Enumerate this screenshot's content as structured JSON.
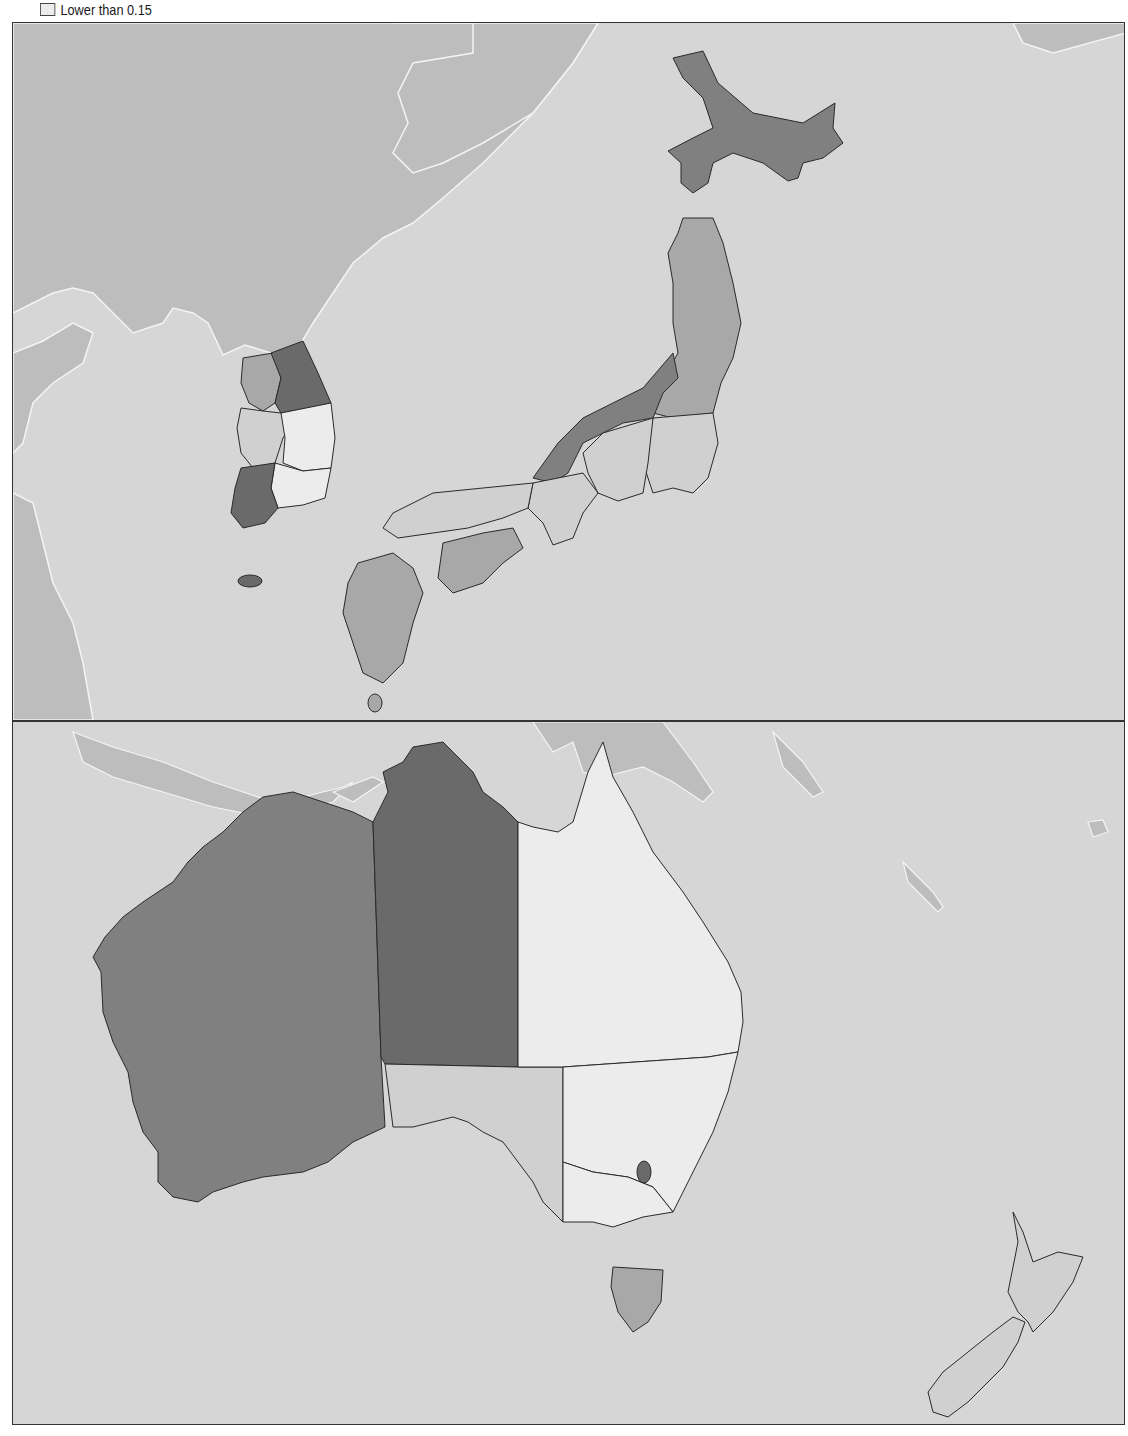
{
  "legend": {
    "items": [
      {
        "label": "Lower than 0.15",
        "color": "#ececec"
      }
    ]
  },
  "colors": {
    "sea": "#d6d6d6",
    "foreign_land": "#bdbdbd",
    "coast_white": "#f4f4f4",
    "class_darkest": "#6a6a6a",
    "class_dark": "#808080",
    "class_mid": "#a8a8a8",
    "class_light": "#d0d0d0",
    "class_lowest": "#ececec",
    "border": "#2a2a2a"
  },
  "panels": [
    {
      "name": "East Asia (Korea & Japan)",
      "regions": [
        {
          "country": "South Korea",
          "region": "Gangwon",
          "class": "class_darkest"
        },
        {
          "country": "South Korea",
          "region": "Gyeonggi",
          "class": "class_mid"
        },
        {
          "country": "South Korea",
          "region": "Chungcheong",
          "class": "class_light"
        },
        {
          "country": "South Korea",
          "region": "Gyeongbuk",
          "class": "class_lowest"
        },
        {
          "country": "South Korea",
          "region": "Gyeongnam",
          "class": "class_lowest"
        },
        {
          "country": "South Korea",
          "region": "Jeolla",
          "class": "class_darkest"
        },
        {
          "country": "South Korea",
          "region": "Jeju",
          "class": "class_darkest"
        },
        {
          "country": "Japan",
          "region": "Hokkaido",
          "class": "class_dark"
        },
        {
          "country": "Japan",
          "region": "Tohoku",
          "class": "class_mid"
        },
        {
          "country": "Japan",
          "region": "Hokuriku",
          "class": "class_dark"
        },
        {
          "country": "Japan",
          "region": "Kanto",
          "class": "class_light"
        },
        {
          "country": "Japan",
          "region": "Chubu",
          "class": "class_light"
        },
        {
          "country": "Japan",
          "region": "Kansai",
          "class": "class_light"
        },
        {
          "country": "Japan",
          "region": "Chugoku",
          "class": "class_light"
        },
        {
          "country": "Japan",
          "region": "Shikoku",
          "class": "class_mid"
        },
        {
          "country": "Japan",
          "region": "Kyushu",
          "class": "class_mid"
        }
      ]
    },
    {
      "name": "Oceania (Australia & New Zealand)",
      "regions": [
        {
          "country": "Australia",
          "region": "Western Australia",
          "class": "class_dark"
        },
        {
          "country": "Australia",
          "region": "Northern Territory",
          "class": "class_darkest"
        },
        {
          "country": "Australia",
          "region": "South Australia",
          "class": "class_light"
        },
        {
          "country": "Australia",
          "region": "Queensland",
          "class": "class_lowest"
        },
        {
          "country": "Australia",
          "region": "New South Wales",
          "class": "class_lowest"
        },
        {
          "country": "Australia",
          "region": "Victoria",
          "class": "class_lowest"
        },
        {
          "country": "Australia",
          "region": "ACT",
          "class": "class_darkest"
        },
        {
          "country": "Australia",
          "region": "Tasmania",
          "class": "class_mid"
        },
        {
          "country": "New Zealand",
          "region": "North Island",
          "class": "class_light"
        },
        {
          "country": "New Zealand",
          "region": "South Island",
          "class": "class_light"
        }
      ]
    }
  ]
}
